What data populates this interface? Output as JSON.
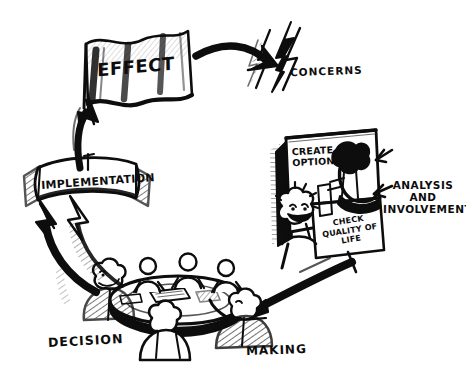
{
  "page": {
    "background_color": "#ffffff",
    "ink_color": "#0d0d0d",
    "cut_off_title": "of Environmental Management",
    "style": "hand-drawn ink cartoon"
  },
  "diagram": {
    "type": "cyclical-process-diagram",
    "direction": "clockwise",
    "stages": [
      {
        "id": "effect",
        "label": "EFFECT",
        "shape": "waving-flag-banner",
        "position": "top-left"
      },
      {
        "id": "concerns",
        "label": "CONCERNS",
        "shape": "lightning-bolt",
        "position": "top-right"
      },
      {
        "id": "analysis",
        "label_lines": [
          "ANALYSIS",
          "AND",
          "INVOLVEMENT"
        ],
        "shape": "flip-chart-panels-with-facilitator",
        "position": "right",
        "panels": [
          {
            "id": "create-options",
            "lines": [
              "CREATE",
              "OPTIONS"
            ]
          },
          {
            "id": "check-quality",
            "lines": [
              "CHECK",
              "QUALITY OF",
              "LIFE"
            ]
          }
        ]
      },
      {
        "id": "decision-making",
        "label_left": "DECISION",
        "label_right": "MAKING",
        "shape": "round-meeting-table-with-seated-people",
        "position": "bottom",
        "people_count": 7
      },
      {
        "id": "implementation",
        "label": "IMPLEMENTATION",
        "shape": "ribbon-scroll-banner",
        "position": "left"
      }
    ],
    "connectors": [
      {
        "id": "effect-to-concerns",
        "from": "effect",
        "to": "concerns",
        "style": "thick-curved-arrow",
        "direction": "right"
      },
      {
        "id": "analysis-to-decision",
        "from": "analysis",
        "to": "decision-making",
        "style": "thick-curved-arrow",
        "direction": "down-left"
      },
      {
        "id": "decision-to-implementation",
        "from": "decision-making",
        "to": "implementation",
        "style": "thick-hatched-arc-arrow",
        "direction": "up-left"
      },
      {
        "id": "implementation-to-effect",
        "from": "implementation",
        "to": "effect",
        "style": "thick-arrow",
        "direction": "up"
      }
    ]
  }
}
